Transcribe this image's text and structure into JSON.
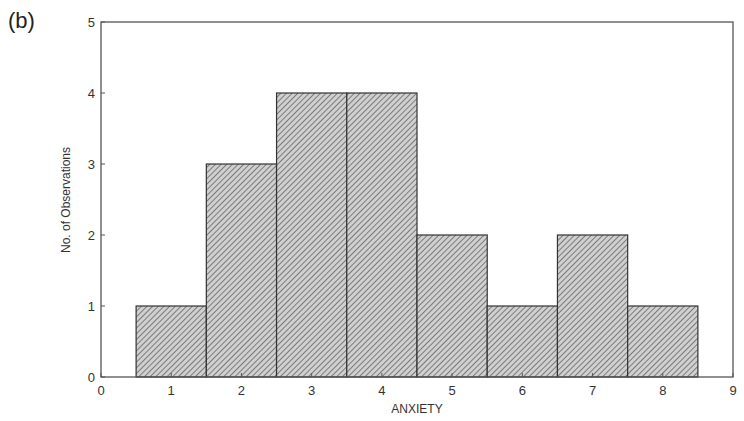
{
  "panel_label": "(b)",
  "chart_data": {
    "type": "bar",
    "subtype": "histogram",
    "title": "",
    "xlabel": "ANXIETY",
    "ylabel": "No. of Observations",
    "categories": [
      "1",
      "2",
      "3",
      "4",
      "5",
      "6",
      "7",
      "8"
    ],
    "x": [
      1,
      2,
      3,
      4,
      5,
      6,
      7,
      8
    ],
    "values": [
      1,
      3,
      4,
      4,
      2,
      1,
      2,
      1
    ],
    "bar_width": 1,
    "xlim": [
      0,
      9
    ],
    "ylim": [
      0,
      5
    ],
    "xticks": [
      "0",
      "1",
      "2",
      "3",
      "4",
      "5",
      "6",
      "7",
      "8",
      "9"
    ],
    "yticks": [
      "0",
      "1",
      "2",
      "3",
      "4",
      "5"
    ],
    "grid": false,
    "legend": null,
    "bar_fill": "diagonal-hatch",
    "bar_color": "#b8b8b8",
    "edge_color": "#333333"
  }
}
